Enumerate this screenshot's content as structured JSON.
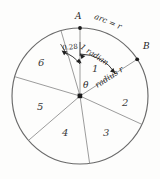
{
  "figure": {
    "background_color": "#fdfdfc",
    "ink_color": "#555555",
    "text_color": "#262626"
  },
  "circle": {
    "center_x": 80,
    "center_y": 96,
    "radius": 68,
    "stroke_color": "#666666"
  },
  "points": {
    "a_label": "A",
    "b_label": "B",
    "center_angle_label": "θ"
  },
  "annotations": {
    "arc_label": "arc = r",
    "radian_label": "1 radian",
    "radius_label": "radius r",
    "remainder_label": "0.28"
  },
  "sectors": [
    {
      "id": "sector-1",
      "label": "1"
    },
    {
      "id": "sector-2",
      "label": "2"
    },
    {
      "id": "sector-3",
      "label": "3"
    },
    {
      "id": "sector-4",
      "label": "4"
    },
    {
      "id": "sector-5",
      "label": "5"
    },
    {
      "id": "sector-6",
      "label": "6"
    }
  ]
}
